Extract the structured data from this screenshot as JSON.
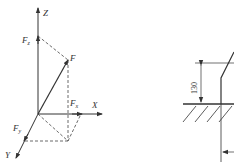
{
  "force_diagram": {
    "axes": {
      "z": "Z",
      "x": "X",
      "y": "Y"
    },
    "force": "F",
    "components": {
      "fz": {
        "main": "F",
        "sub": "z"
      },
      "fx": {
        "main": "F",
        "sub": "x"
      },
      "fy": {
        "main": "F",
        "sub": "y"
      }
    }
  },
  "dimension_drawing": {
    "dimension_value": "130"
  },
  "colors": {
    "line": "#333333"
  }
}
